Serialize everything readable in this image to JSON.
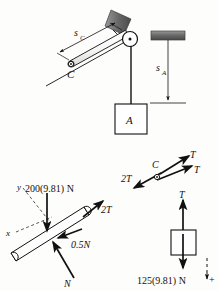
{
  "figure": {
    "type": "engineering-mechanics-free-body-diagram",
    "background_color": "#fdfdfc",
    "ink_color": "#111111",
    "hatch_color": "#6e6e6e"
  },
  "system_diagram": {
    "name": "pulley-incline-system",
    "labels": {
      "distance_sC": "s",
      "distance_sC_sub": "C",
      "distance_sA": "s",
      "distance_sA_sub": "A",
      "pulley_C": "C",
      "block_A": "A"
    }
  },
  "fbd_bar": {
    "name": "inclined-bar-free-body-diagram",
    "labels": {
      "axis_y": "y",
      "axis_x": "x",
      "weight": "200(9.81) N",
      "tension": "2T",
      "friction": "0.5N",
      "normal": "N"
    }
  },
  "fbd_pulley": {
    "name": "pulley-c-free-body-diagram",
    "labels": {
      "pulley": "C",
      "tension_left": "2T",
      "tension_upper": "T",
      "tension_lower": "T"
    }
  },
  "fbd_block": {
    "name": "block-free-body-diagram",
    "labels": {
      "tension": "T",
      "weight": "125(9.81) N",
      "sign_convention": "+"
    }
  }
}
